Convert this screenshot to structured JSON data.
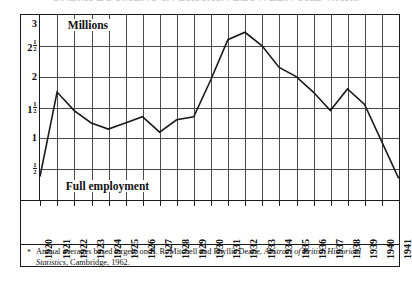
{
  "title": {
    "remnant": "UNEMPLOYMENT IN BRITAIN BETWEEN THE WARS"
  },
  "annotations": {
    "millions": "Millions",
    "full_employment": "Full employment"
  },
  "footnote": {
    "marker": "*",
    "line1": "Annual averages based largely on B. R. Mitchell and Phyllis Deane,",
    "line2_italic": "Abstract of British Historical Statistics",
    "line2_rest": ", Cambridge, 1962."
  },
  "colors": {
    "line": "#1a1a1a",
    "grid": "#4a4a4a",
    "frame": "#1a1a1a",
    "background": "#ffffff"
  },
  "chart_data": {
    "type": "line",
    "title": "Unemployment in Britain between the wars",
    "xlabel": "",
    "ylabel": "Millions",
    "ylim": [
      0,
      3
    ],
    "xlim": [
      1920,
      1941
    ],
    "grid": true,
    "legend": false,
    "ytick_labels": [
      "3",
      "2½",
      "2",
      "1½",
      "1",
      "½"
    ],
    "ytick_values": [
      3,
      2.5,
      2,
      1.5,
      1,
      0.5
    ],
    "categories": [
      "1920",
      "1921",
      "1922",
      "1923",
      "1924",
      "1925",
      "1926",
      "1927",
      "1928",
      "1929",
      "1930",
      "1931",
      "1932",
      "1933",
      "1934",
      "1935",
      "1936",
      "1937",
      "1938",
      "1939",
      "1940",
      "1941"
    ],
    "values": [
      0.38,
      1.75,
      1.45,
      1.25,
      1.15,
      1.25,
      1.35,
      1.1,
      1.3,
      1.35,
      1.95,
      2.6,
      2.72,
      2.5,
      2.15,
      2.0,
      1.75,
      1.45,
      1.8,
      1.55,
      0.95,
      0.35
    ],
    "annotations": [
      "Millions",
      "Full employment"
    ],
    "source_note": "Annual averages based largely on B. R. Mitchell and Phyllis Deane, Abstract of British Historical Statistics, Cambridge, 1962."
  }
}
